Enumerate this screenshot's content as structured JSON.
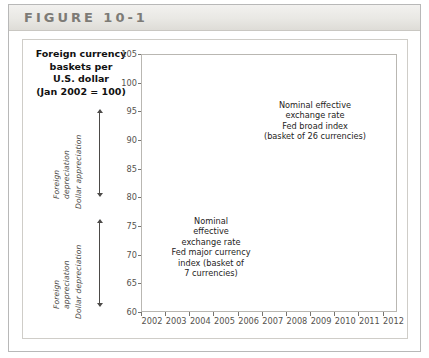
{
  "figure": {
    "label": "FIGURE 10-1"
  },
  "axis_title": {
    "line1": "Foreign currency",
    "line2": "baskets per",
    "line3": "U.S. dollar",
    "line4": "(Jan 2002 = 100)"
  },
  "direction_labels": {
    "upper": {
      "line1": "Foreign",
      "line2": "depreciation",
      "line3": "Dollar appreciation"
    },
    "lower": {
      "line1": "Foreign",
      "line2": "appreciation",
      "line3": "Dollar depreciation"
    }
  },
  "annotations": {
    "broad": "Nominal effective exchange rate Fed broad index (basket of 26 currencies)",
    "broad_lines": [
      "Nominal effective",
      "exchange rate",
      "Fed broad index",
      "(basket of 26 currencies)"
    ],
    "major": "Nominal effective exchange rate Fed major currency index (basket of 7 currencies)",
    "major_lines": [
      "Nominal",
      "effective",
      "exchange rate",
      "Fed major currency",
      "index (basket of",
      "7 currencies)"
    ]
  },
  "colors": {
    "broad_line": "#4a4845",
    "major_line": "#8a8884",
    "grid": "#ededed",
    "frame": "#b9b7b2",
    "header_text": "#7d7b76"
  },
  "chart_data": {
    "type": "line",
    "title": "Foreign currency baskets per U.S. dollar (Jan 2002 = 100)",
    "xlabel": "",
    "ylabel": "Foreign currency baskets per U.S. dollar (Jan 2002 = 100)",
    "xlim": [
      2002.0,
      2012.6
    ],
    "ylim": [
      60,
      105
    ],
    "yticks": [
      105,
      100,
      95,
      90,
      85,
      80,
      75,
      70,
      65,
      60
    ],
    "xticks": [
      2002,
      2003,
      2004,
      2005,
      2006,
      2007,
      2008,
      2009,
      2010,
      2011,
      2012
    ],
    "grid": true,
    "legend": "annotations-inline",
    "series": [
      {
        "name": "Nominal effective exchange rate Fed broad index (basket of 26 currencies)",
        "color": "#4a4845",
        "x": [
          2002.0,
          2002.08,
          2002.17,
          2002.25,
          2002.33,
          2002.42,
          2002.5,
          2002.58,
          2002.67,
          2002.75,
          2002.83,
          2002.92,
          2003.0,
          2003.08,
          2003.17,
          2003.25,
          2003.33,
          2003.42,
          2003.5,
          2003.58,
          2003.67,
          2003.75,
          2003.83,
          2003.92,
          2004.0,
          2004.08,
          2004.17,
          2004.25,
          2004.33,
          2004.42,
          2004.5,
          2004.58,
          2004.67,
          2004.75,
          2004.83,
          2004.92,
          2005.0,
          2005.08,
          2005.17,
          2005.25,
          2005.33,
          2005.42,
          2005.5,
          2005.58,
          2005.67,
          2005.75,
          2005.83,
          2005.92,
          2006.0,
          2006.08,
          2006.17,
          2006.25,
          2006.33,
          2006.42,
          2006.5,
          2006.58,
          2006.67,
          2006.75,
          2006.83,
          2006.92,
          2007.0,
          2007.08,
          2007.17,
          2007.25,
          2007.33,
          2007.42,
          2007.5,
          2007.58,
          2007.67,
          2007.75,
          2007.83,
          2007.92,
          2008.0,
          2008.08,
          2008.17,
          2008.25,
          2008.33,
          2008.42,
          2008.5,
          2008.58,
          2008.67,
          2008.75,
          2008.83,
          2008.92,
          2009.0,
          2009.08,
          2009.17,
          2009.25,
          2009.33,
          2009.42,
          2009.5,
          2009.58,
          2009.67,
          2009.75,
          2009.83,
          2009.92,
          2010.0,
          2010.08,
          2010.17,
          2010.25,
          2010.33,
          2010.42,
          2010.5,
          2010.58,
          2010.67,
          2010.75,
          2010.83,
          2010.92,
          2011.0,
          2011.08,
          2011.17,
          2011.25,
          2011.33,
          2011.42,
          2011.5,
          2011.58,
          2011.67,
          2011.75,
          2011.83,
          2011.92,
          2012.0,
          2012.08,
          2012.17,
          2012.25,
          2012.33,
          2012.42,
          2012.5
        ],
        "y": [
          100.3,
          100.8,
          99.4,
          98.0,
          96.3,
          95.6,
          96.2,
          98.2,
          99.1,
          97.5,
          96.8,
          96.2,
          95.8,
          96.5,
          95.1,
          94.6,
          93.2,
          92.6,
          93.3,
          93.0,
          92.1,
          91.4,
          90.6,
          89.8,
          90.2,
          91.0,
          90.6,
          91.8,
          92.0,
          91.0,
          90.4,
          90.0,
          89.5,
          88.6,
          87.6,
          87.0,
          87.5,
          88.6,
          89.4,
          90.4,
          89.8,
          89.0,
          88.9,
          88.3,
          88.0,
          88.4,
          88.0,
          87.2,
          86.8,
          86.2,
          85.6,
          85.0,
          84.7,
          85.1,
          85.3,
          85.0,
          85.6,
          85.4,
          85.2,
          84.9,
          85.2,
          86.2,
          86.0,
          86.5,
          85.9,
          85.8,
          85.3,
          85.8,
          85.2,
          84.6,
          84.2,
          83.8,
          84.2,
          84.0,
          83.4,
          82.8,
          82.4,
          82.2,
          82.0,
          83.5,
          85.6,
          88.2,
          89.8,
          89.0,
          90.2,
          92.0,
          91.4,
          89.6,
          87.8,
          85.8,
          84.6,
          84.0,
          83.2,
          82.6,
          82.4,
          83.0,
          83.4,
          84.6,
          84.0,
          82.8,
          83.6,
          85.4,
          85.0,
          83.8,
          82.6,
          81.6,
          81.0,
          80.8,
          80.6,
          80.2,
          79.8,
          78.8,
          78.4,
          78.6,
          78.2,
          77.8,
          78.8,
          79.8,
          79.2,
          78.8,
          79.0,
          78.6,
          78.0,
          78.6,
          79.4,
          78.8,
          78.6
        ]
      },
      {
        "name": "Nominal effective exchange rate Fed major currency index (basket of 7 currencies)",
        "color": "#8a8884",
        "x": [
          2002.0,
          2002.08,
          2002.17,
          2002.25,
          2002.33,
          2002.42,
          2002.5,
          2002.58,
          2002.67,
          2002.75,
          2002.83,
          2002.92,
          2003.0,
          2003.08,
          2003.17,
          2003.25,
          2003.33,
          2003.42,
          2003.5,
          2003.58,
          2003.67,
          2003.75,
          2003.83,
          2003.92,
          2004.0,
          2004.08,
          2004.17,
          2004.25,
          2004.33,
          2004.42,
          2004.5,
          2004.58,
          2004.67,
          2004.75,
          2004.83,
          2004.92,
          2005.0,
          2005.08,
          2005.17,
          2005.25,
          2005.33,
          2005.42,
          2005.5,
          2005.58,
          2005.67,
          2005.75,
          2005.83,
          2005.92,
          2006.0,
          2006.08,
          2006.17,
          2006.25,
          2006.33,
          2006.42,
          2006.5,
          2006.58,
          2006.67,
          2006.75,
          2006.83,
          2006.92,
          2007.0,
          2007.08,
          2007.17,
          2007.25,
          2007.33,
          2007.42,
          2007.5,
          2007.58,
          2007.67,
          2007.75,
          2007.83,
          2007.92,
          2008.0,
          2008.08,
          2008.17,
          2008.25,
          2008.33,
          2008.42,
          2008.5,
          2008.58,
          2008.67,
          2008.75,
          2008.83,
          2008.92,
          2009.0,
          2009.08,
          2009.17,
          2009.25,
          2009.33,
          2009.42,
          2009.5,
          2009.58,
          2009.67,
          2009.75,
          2009.83,
          2009.92,
          2010.0,
          2010.08,
          2010.17,
          2010.25,
          2010.33,
          2010.42,
          2010.5,
          2010.58,
          2010.67,
          2010.75,
          2010.83,
          2010.92,
          2011.0,
          2011.08,
          2011.17,
          2011.25,
          2011.33,
          2011.42,
          2011.5,
          2011.58,
          2011.67,
          2011.75,
          2011.83,
          2011.92,
          2012.0,
          2012.08,
          2012.17,
          2012.25,
          2012.33,
          2012.42,
          2012.5
        ],
        "y": [
          100.2,
          100.0,
          98.2,
          96.0,
          93.4,
          91.6,
          92.8,
          93.4,
          92.8,
          91.2,
          90.0,
          89.0,
          88.4,
          88.8,
          87.2,
          86.6,
          85.2,
          84.4,
          85.0,
          84.6,
          83.2,
          82.4,
          81.2,
          80.2,
          80.8,
          82.4,
          83.4,
          84.6,
          84.0,
          82.6,
          81.8,
          81.0,
          80.0,
          78.4,
          76.6,
          75.4,
          76.0,
          77.4,
          78.6,
          79.8,
          79.0,
          78.2,
          78.0,
          77.2,
          76.6,
          77.0,
          76.2,
          75.0,
          74.6,
          74.0,
          73.4,
          72.6,
          72.2,
          72.8,
          73.2,
          72.8,
          73.4,
          73.2,
          72.8,
          72.4,
          72.6,
          73.8,
          73.6,
          74.2,
          73.4,
          73.2,
          72.6,
          73.0,
          72.2,
          71.2,
          70.2,
          69.4,
          69.8,
          69.4,
          68.4,
          67.4,
          66.6,
          66.2,
          65.6,
          67.4,
          70.2,
          73.2,
          75.4,
          74.4,
          75.8,
          78.0,
          77.2,
          74.8,
          72.6,
          70.0,
          68.6,
          68.0,
          67.0,
          66.2,
          65.8,
          66.6,
          67.2,
          68.8,
          68.2,
          66.8,
          68.0,
          70.4,
          70.0,
          68.6,
          67.0,
          65.8,
          65.0,
          64.8,
          64.6,
          64.2,
          63.6,
          62.4,
          62.0,
          62.2,
          61.8,
          61.2,
          62.6,
          64.0,
          63.2,
          62.6,
          62.8,
          62.4,
          61.8,
          62.6,
          63.6,
          62.8,
          62.6
        ]
      }
    ]
  }
}
